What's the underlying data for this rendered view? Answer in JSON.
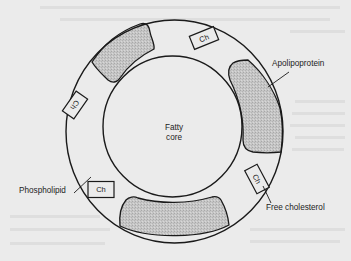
{
  "figure": {
    "type": "lipoprotein particle cross-section diagram",
    "background_color": "#ebebeb",
    "line_color": "#1a1a1a",
    "apolipoprotein_fill": "#c4c4c4"
  },
  "center": {
    "line1": "Fatty",
    "line2": "core"
  },
  "labels": {
    "apolipoprotein": "Apolipoprotein",
    "phospholipid": "Phospholipid",
    "free_cholesterol": "Free cholesterol"
  },
  "cholesterol_boxes": [
    {
      "id": "top",
      "text": "Ch"
    },
    {
      "id": "left",
      "text": "Ch"
    },
    {
      "id": "phospholipid-side",
      "text": "Ch"
    },
    {
      "id": "right-lower",
      "text": "Ch"
    }
  ],
  "apolipoprotein_patches": [
    "top-left",
    "right",
    "bottom"
  ]
}
